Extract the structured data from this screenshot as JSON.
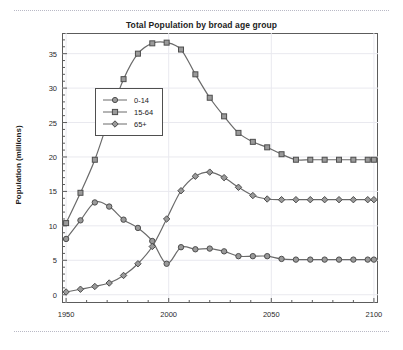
{
  "decor": {
    "top_rule": "dotted-rule",
    "bottom_rule": "dotted-rule"
  },
  "chart_data": {
    "type": "line",
    "title": "Total Population by broad age group",
    "xlabel": "",
    "ylabel": "Population (millions)",
    "xlim": [
      1948,
      2102
    ],
    "ylim": [
      -1.2,
      38
    ],
    "xticks": [
      1950,
      2000,
      2050,
      2100
    ],
    "yticks": [
      0,
      5,
      10,
      15,
      20,
      25,
      30,
      35
    ],
    "minor_ticks": true,
    "grid": true,
    "legend_position": "center-left",
    "line_color": "#6a6a6a",
    "marker_face": "#9a9a9a",
    "x": [
      1950,
      1957,
      1964,
      1971,
      1978,
      1985,
      1992,
      1999,
      2006,
      2013,
      2020,
      2027,
      2034,
      2041,
      2048,
      2055,
      2062,
      2069,
      2076,
      2083,
      2090,
      2097,
      2100
    ],
    "series": [
      {
        "name": "0-14",
        "marker": "circle",
        "values": [
          8.1,
          10.8,
          13.4,
          12.8,
          10.9,
          9.7,
          7.8,
          4.5,
          6.9,
          6.6,
          6.7,
          6.3,
          5.6,
          5.6,
          5.6,
          5.2,
          5.1,
          5.1,
          5.1,
          5.1,
          5.1,
          5.1,
          5.1
        ]
      },
      {
        "name": "15-64",
        "marker": "square",
        "values": [
          10.4,
          14.8,
          19.6,
          25.7,
          31.3,
          35.0,
          36.5,
          36.6,
          35.6,
          32.0,
          28.6,
          25.9,
          23.5,
          22.2,
          21.4,
          20.4,
          19.6,
          19.6,
          19.6,
          19.6,
          19.6,
          19.6,
          19.6
        ]
      },
      {
        "name": "65+",
        "marker": "diamond",
        "values": [
          0.4,
          0.8,
          1.2,
          1.7,
          2.8,
          4.5,
          7.0,
          11.0,
          15.1,
          17.2,
          17.8,
          17.0,
          15.6,
          14.4,
          13.9,
          13.8,
          13.8,
          13.8,
          13.8,
          13.8,
          13.8,
          13.8,
          13.8
        ]
      }
    ],
    "series_points": {
      "0-14": [
        [
          1950,
          8.1
        ],
        [
          1957,
          10.8
        ],
        [
          1964,
          13.4
        ],
        [
          1971,
          12.8
        ],
        [
          1978,
          10.9
        ],
        [
          1985,
          9.7
        ],
        [
          1992,
          7.8
        ],
        [
          1999,
          4.5
        ],
        [
          2006,
          6.9
        ],
        [
          2013,
          6.6
        ],
        [
          2020,
          6.7
        ],
        [
          2027,
          6.3
        ],
        [
          2034,
          5.6
        ],
        [
          2041,
          5.6
        ],
        [
          2048,
          5.6
        ],
        [
          2055,
          5.2
        ],
        [
          2062,
          5.1
        ],
        [
          2069,
          5.1
        ],
        [
          2076,
          5.1
        ],
        [
          2083,
          5.1
        ],
        [
          2090,
          5.1
        ],
        [
          2097,
          5.1
        ],
        [
          2100,
          5.1
        ]
      ],
      "15-64": [
        [
          1950,
          10.4
        ],
        [
          1957,
          14.8
        ],
        [
          1964,
          19.6
        ],
        [
          1971,
          25.7
        ],
        [
          1978,
          31.3
        ],
        [
          1985,
          35.0
        ],
        [
          1992,
          36.5
        ],
        [
          1999,
          36.6
        ],
        [
          2006,
          35.6
        ],
        [
          2013,
          32.0
        ],
        [
          2020,
          28.6
        ],
        [
          2027,
          25.9
        ],
        [
          2034,
          23.5
        ],
        [
          2041,
          22.2
        ],
        [
          2048,
          21.4
        ],
        [
          2055,
          20.4
        ],
        [
          2062,
          19.6
        ],
        [
          2069,
          19.6
        ],
        [
          2076,
          19.6
        ],
        [
          2083,
          19.6
        ],
        [
          2090,
          19.6
        ],
        [
          2097,
          19.6
        ],
        [
          2100,
          19.6
        ]
      ],
      "65+": [
        [
          1950,
          0.4
        ],
        [
          1957,
          0.8
        ],
        [
          1964,
          1.2
        ],
        [
          1971,
          1.7
        ],
        [
          1978,
          2.8
        ],
        [
          1985,
          4.5
        ],
        [
          1992,
          7.0
        ],
        [
          1999,
          11.0
        ],
        [
          2006,
          15.1
        ],
        [
          2013,
          17.2
        ],
        [
          2020,
          17.8
        ],
        [
          2027,
          17.0
        ],
        [
          2034,
          15.6
        ],
        [
          2041,
          14.4
        ],
        [
          2048,
          13.9
        ],
        [
          2055,
          13.8
        ],
        [
          2062,
          13.8
        ],
        [
          2069,
          13.8
        ],
        [
          2076,
          13.8
        ],
        [
          2083,
          13.8
        ],
        [
          2090,
          13.8
        ],
        [
          2097,
          13.8
        ],
        [
          2100,
          13.8
        ]
      ]
    }
  }
}
